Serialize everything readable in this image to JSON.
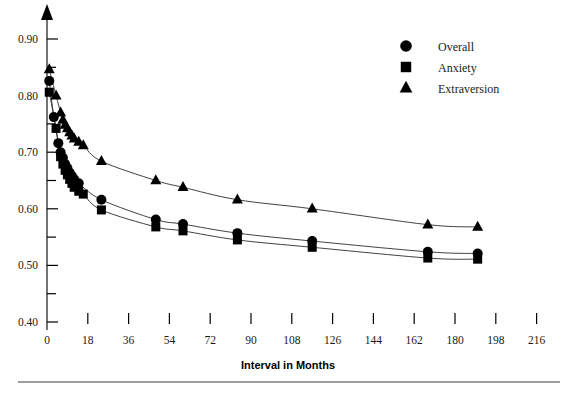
{
  "chart_data": {
    "type": "scatter",
    "title": "",
    "xlabel": "Interval in Months",
    "ylabel": "",
    "xlim": [
      0,
      216
    ],
    "ylim": [
      0.4,
      0.93
    ],
    "grid": false,
    "legend_position": "top-right",
    "x_ticks": [
      0,
      18,
      36,
      54,
      72,
      90,
      108,
      126,
      144,
      162,
      180,
      198,
      216
    ],
    "x_tick_labels": [
      "0",
      "18",
      "36",
      "54",
      "72",
      "90",
      "108",
      "126",
      "144",
      "162",
      "180",
      "198",
      "216"
    ],
    "y_ticks": [
      0.4,
      0.45,
      0.5,
      0.55,
      0.6,
      0.65,
      0.7,
      0.75,
      0.8,
      0.85,
      0.9
    ],
    "y_tick_labels": [
      "0.40",
      "",
      "0.50",
      "",
      "0.60",
      "",
      "0.70",
      "",
      "0.80",
      "",
      "0.90"
    ],
    "y_major_labels": [
      "0.90",
      "0.80",
      "0.70",
      "0.60",
      "0.50",
      "0.40"
    ],
    "series": [
      {
        "name": "Overall",
        "marker": "circle",
        "color": "#000000",
        "points": [
          {
            "x": 1,
            "y": 0.826
          },
          {
            "x": 3,
            "y": 0.762
          },
          {
            "x": 5,
            "y": 0.716
          },
          {
            "x": 6,
            "y": 0.7
          },
          {
            "x": 7,
            "y": 0.69
          },
          {
            "x": 8,
            "y": 0.679
          },
          {
            "x": 9,
            "y": 0.672
          },
          {
            "x": 10,
            "y": 0.664
          },
          {
            "x": 11,
            "y": 0.658
          },
          {
            "x": 12,
            "y": 0.652
          },
          {
            "x": 14,
            "y": 0.645
          },
          {
            "x": 24,
            "y": 0.616
          },
          {
            "x": 48,
            "y": 0.581
          },
          {
            "x": 60,
            "y": 0.573
          },
          {
            "x": 84,
            "y": 0.557
          },
          {
            "x": 117,
            "y": 0.543
          },
          {
            "x": 168,
            "y": 0.524
          },
          {
            "x": 190,
            "y": 0.521
          }
        ]
      },
      {
        "name": "Anxiety",
        "marker": "square",
        "color": "#000000",
        "points": [
          {
            "x": 1,
            "y": 0.806
          },
          {
            "x": 4,
            "y": 0.742
          },
          {
            "x": 6,
            "y": 0.692
          },
          {
            "x": 7,
            "y": 0.679
          },
          {
            "x": 8,
            "y": 0.668
          },
          {
            "x": 9,
            "y": 0.66
          },
          {
            "x": 10,
            "y": 0.652
          },
          {
            "x": 11,
            "y": 0.645
          },
          {
            "x": 12,
            "y": 0.638
          },
          {
            "x": 14,
            "y": 0.631
          },
          {
            "x": 16,
            "y": 0.626
          },
          {
            "x": 24,
            "y": 0.598
          },
          {
            "x": 48,
            "y": 0.568
          },
          {
            "x": 60,
            "y": 0.561
          },
          {
            "x": 84,
            "y": 0.545
          },
          {
            "x": 117,
            "y": 0.532
          },
          {
            "x": 168,
            "y": 0.513
          },
          {
            "x": 190,
            "y": 0.511
          }
        ]
      },
      {
        "name": "Extraversion",
        "marker": "triangle",
        "color": "#000000",
        "points": [
          {
            "x": 1,
            "y": 0.846
          },
          {
            "x": 4,
            "y": 0.8
          },
          {
            "x": 6,
            "y": 0.77
          },
          {
            "x": 7,
            "y": 0.757
          },
          {
            "x": 8,
            "y": 0.748
          },
          {
            "x": 9,
            "y": 0.742
          },
          {
            "x": 10,
            "y": 0.735
          },
          {
            "x": 11,
            "y": 0.729
          },
          {
            "x": 12,
            "y": 0.724
          },
          {
            "x": 14,
            "y": 0.718
          },
          {
            "x": 16,
            "y": 0.712
          },
          {
            "x": 24,
            "y": 0.684
          },
          {
            "x": 48,
            "y": 0.65
          },
          {
            "x": 60,
            "y": 0.638
          },
          {
            "x": 84,
            "y": 0.616
          },
          {
            "x": 117,
            "y": 0.6
          },
          {
            "x": 168,
            "y": 0.572
          },
          {
            "x": 190,
            "y": 0.568
          }
        ]
      }
    ],
    "legend": [
      {
        "label": "Overall",
        "marker": "circle"
      },
      {
        "label": "Anxiety",
        "marker": "square"
      },
      {
        "label": "Extraversion",
        "marker": "triangle"
      }
    ]
  }
}
